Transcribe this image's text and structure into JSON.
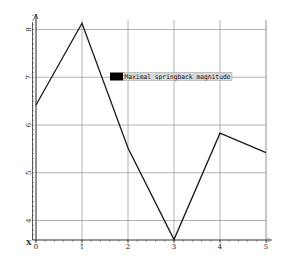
{
  "chart_data": {
    "type": "line",
    "title": "",
    "xlabel": "X",
    "ylabel": "",
    "x": [
      0,
      1,
      2,
      3,
      4,
      5
    ],
    "series": [
      {
        "name": "Maximal springback magnitude",
        "values": [
          6.42,
          8.13,
          5.52,
          3.6,
          5.83,
          5.42
        ],
        "color": "#1a1a1a"
      }
    ],
    "x_ticks": [
      "0",
      "1",
      "2",
      "3",
      "4",
      "5"
    ],
    "y_ticks": [
      "4",
      "5",
      "6",
      "7",
      "8"
    ],
    "xlim": [
      0,
      5
    ],
    "ylim": [
      3.6,
      8.2
    ],
    "grid": true,
    "legend_position": "upper-center"
  },
  "axis": {
    "x_label": "X"
  },
  "legend": {
    "label": "Maximal springback magnitude",
    "swatch_color": "#000000",
    "background": "#d8d8d8"
  },
  "colors": {
    "grid": "#a0a0a0",
    "axis": "#333333",
    "line": "#1a1a1a"
  }
}
